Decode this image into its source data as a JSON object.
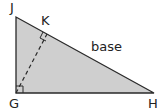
{
  "diagram": {
    "type": "right-triangle",
    "vertices": {
      "J": {
        "label": "J",
        "x": 16,
        "y": 17
      },
      "G": {
        "label": "G",
        "x": 16,
        "y": 93
      },
      "H": {
        "label": "H",
        "x": 154,
        "y": 93
      },
      "K": {
        "label": "K",
        "x": 47,
        "y": 34
      }
    },
    "side_label": "base",
    "fill_color": "#cfcfcf",
    "stroke_color": "#2a2a2a",
    "altitude": "GK dashed, perpendicular to JH",
    "right_angles": [
      "G",
      "K"
    ]
  }
}
